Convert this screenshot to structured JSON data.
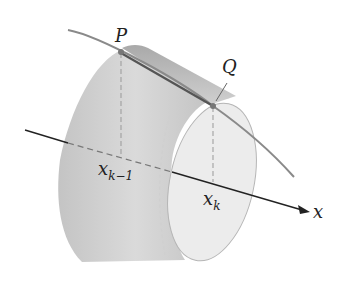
{
  "diagram": {
    "type": "frustum-surface-of-revolution",
    "labels": {
      "P": "P",
      "Q": "Q",
      "x_prev": "x",
      "x_prev_sub": "k−1",
      "x_k": "x",
      "x_k_sub": "k",
      "axis": "x"
    },
    "colors": {
      "frustum_fill": "#c9c9c9",
      "frustum_dark": "#a8a8a8",
      "inner_face": "#ececec",
      "curve": "#8a8a8a",
      "segment": "#555555",
      "axis": "#222222"
    }
  }
}
